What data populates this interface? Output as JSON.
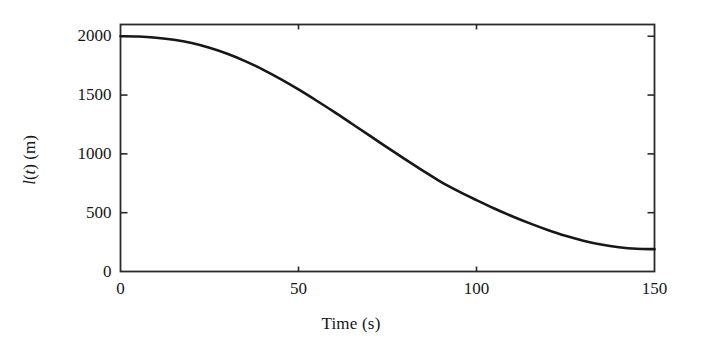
{
  "figure": {
    "background_color": "#ffffff",
    "curve_color": "#171717",
    "axis_color": "#2a2a2a"
  },
  "chart_data": {
    "type": "line",
    "title": "",
    "subtitle": "",
    "xlabel": "Time (s)",
    "ylabel": "l(t) (m)",
    "ylabel_parts": {
      "symbol": "l",
      "variable": "t",
      "unit": "m"
    },
    "xlim": [
      0,
      150
    ],
    "ylim": [
      0,
      2100
    ],
    "xticks": [
      0,
      50,
      100,
      150
    ],
    "xticklabels": [
      "0",
      "50",
      "100",
      "150"
    ],
    "yticks": [
      0,
      500,
      1000,
      1500,
      2000
    ],
    "yticklabels": [
      "0",
      "500",
      "1000",
      "1500",
      "2000"
    ],
    "grid": false,
    "legend": null,
    "tick_direction": "in",
    "frame": "box",
    "series": [
      {
        "name": "l(t)",
        "color": "#171717",
        "linewidth": 2.6,
        "x": [
          0,
          5,
          10,
          15,
          20,
          25,
          30,
          35,
          40,
          45,
          50,
          55,
          60,
          65,
          70,
          75,
          80,
          85,
          90,
          95,
          100,
          105,
          110,
          115,
          120,
          125,
          130,
          135,
          140,
          145,
          150
        ],
        "values": [
          2000,
          1998,
          1988,
          1970,
          1942,
          1902,
          1851,
          1789,
          1717,
          1636,
          1548,
          1454,
          1357,
          1256,
          1155,
          1053,
          953,
          856,
          762,
          681,
          607,
          536,
          470,
          409,
          353,
          303,
          262,
          229,
          206,
          193,
          190
        ]
      }
    ],
    "annotations": []
  }
}
